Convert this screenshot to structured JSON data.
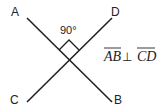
{
  "diagram": {
    "points": {
      "A": "A",
      "B": "B",
      "C": "C",
      "D": "D"
    },
    "angle_label": "90°",
    "relation": {
      "left": "AB",
      "operator": "⊥",
      "right": "CD"
    },
    "line_color": "#222222"
  }
}
